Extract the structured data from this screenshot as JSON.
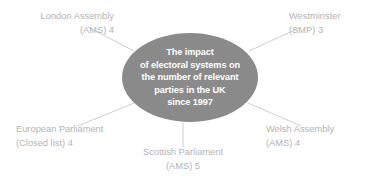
{
  "diagram": {
    "title": "The impact of electoral systems on the number of relevant parties in the UK since 1997",
    "center": {
      "lines": [
        "The impact",
        "of electoral systems on",
        "the number of relevant",
        "parties in the UK",
        "since 1997"
      ],
      "fill_color": "#8a8a8a",
      "text_color": "#ffffff"
    },
    "label_color": "#b4b4b4",
    "connector_color": "#c8c8c8",
    "nodes": [
      {
        "id": "london",
        "name": "London Assembly",
        "system": "(AMS) 4",
        "system_code": "AMS",
        "value": 4,
        "position": "top-left"
      },
      {
        "id": "westminster",
        "name": "Westminster",
        "system": "(SMP) 3",
        "system_code": "SMP",
        "value": 3,
        "position": "top-right"
      },
      {
        "id": "european",
        "name": "European Parliament",
        "system": "(Closed list) 4",
        "system_code": "Closed list",
        "value": 4,
        "position": "bottom-left"
      },
      {
        "id": "scottish",
        "name": "Scottish Parliament",
        "system": "(AMS) 5",
        "system_code": "AMS",
        "value": 5,
        "position": "bottom-center"
      },
      {
        "id": "welsh",
        "name": "Welsh Assembly",
        "system": "(AMS) 4",
        "system_code": "AMS",
        "value": 4,
        "position": "bottom-right"
      }
    ]
  }
}
